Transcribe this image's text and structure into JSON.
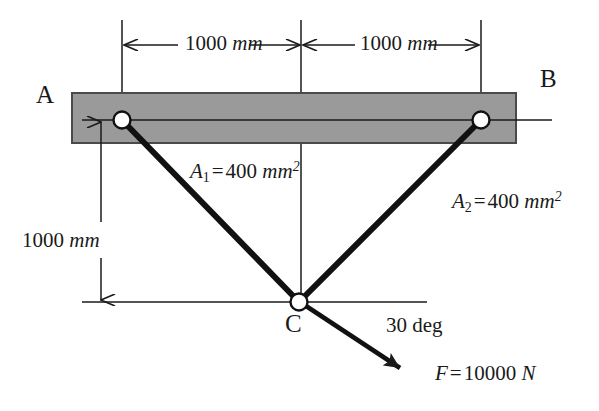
{
  "figure": {
    "type": "engineering-truss-diagram",
    "background_color": "#ffffff",
    "ink_color": "#1a1a1a",
    "block_fill_color": "#9a9a9a",
    "block_stroke_color": "#4a4a4a",
    "pin_fill_color": "#ffffff"
  },
  "nodes": {
    "a_label": "A",
    "b_label": "B",
    "c_label": "C"
  },
  "dimensions": {
    "top_left": {
      "value": "1000",
      "unit": "mm"
    },
    "top_right": {
      "value": "1000",
      "unit": "mm"
    },
    "vertical_left": {
      "value": "1000",
      "unit": "mm"
    }
  },
  "members": {
    "member_1": {
      "symbol": "A",
      "subscript": "1",
      "equals": "=",
      "value": "400",
      "unit": "mm",
      "superscript": "2",
      "full_text": "A1 = 400 mm2"
    },
    "member_2": {
      "symbol": "A",
      "subscript": "2",
      "equals": "=",
      "value": "400",
      "unit": "mm",
      "superscript": "2",
      "full_text": "A2 = 400 mm2"
    }
  },
  "load": {
    "angle_label": "30 deg",
    "force": {
      "symbol": "F",
      "equals": "=",
      "value": "10000",
      "unit": "N",
      "full_text": "F = 10000 N"
    }
  },
  "geometry_px": {
    "pin_left": [
      122,
      120
    ],
    "pin_right": [
      481,
      120
    ],
    "joint_c": [
      299,
      302
    ],
    "block": {
      "x": 72,
      "y": 93,
      "w": 444,
      "h": 50
    },
    "dim_line_y": 45,
    "center_line_x": 301,
    "vertical_dim_x": 101,
    "ground_line_y": 302,
    "force_arrow_tip": [
      406,
      371
    ]
  }
}
